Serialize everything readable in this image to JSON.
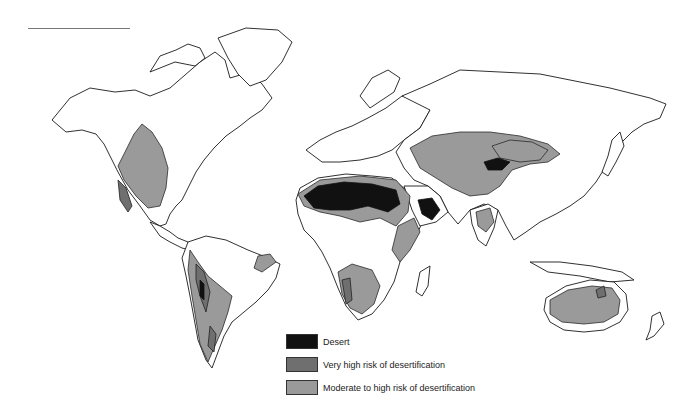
{
  "map": {
    "title": "World desertification risk map",
    "colors": {
      "background": "#ffffff",
      "land": "#ffffff",
      "outline": "#1a1a1a",
      "desert": "#111111",
      "very_high_risk": "#6f6f6f",
      "moderate_to_high_risk": "#9a9a9a"
    }
  },
  "legend": {
    "items": [
      {
        "label": "Desert",
        "color": "#111111"
      },
      {
        "label": "Very high risk of desertification",
        "color": "#6f6f6f"
      },
      {
        "label": "Moderate to high risk of desertification",
        "color": "#9a9a9a"
      }
    ]
  }
}
